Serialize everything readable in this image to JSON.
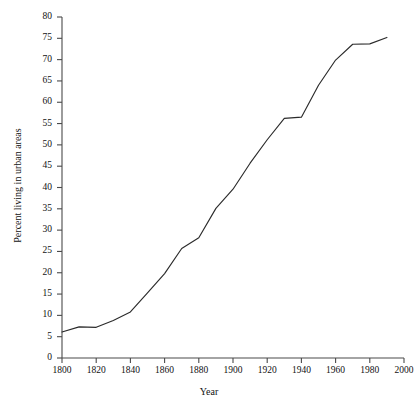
{
  "chart_data": {
    "type": "line",
    "title": "",
    "xlabel": "Year",
    "ylabel": "Percent living in urban areas",
    "xlim": [
      1800,
      2000
    ],
    "ylim": [
      0,
      80
    ],
    "xticks": [
      1800,
      1820,
      1840,
      1860,
      1880,
      1900,
      1920,
      1940,
      1960,
      1980,
      2000
    ],
    "yticks": [
      0,
      5,
      10,
      15,
      20,
      25,
      30,
      35,
      40,
      45,
      50,
      55,
      60,
      65,
      70,
      75,
      80
    ],
    "grid": false,
    "legend": false,
    "line_color": "#2b2b2b",
    "x": [
      1800,
      1810,
      1820,
      1830,
      1840,
      1850,
      1860,
      1870,
      1880,
      1890,
      1900,
      1910,
      1920,
      1930,
      1940,
      1950,
      1960,
      1970,
      1980,
      1990
    ],
    "values": [
      6.1,
      7.3,
      7.2,
      8.8,
      10.8,
      15.3,
      19.8,
      25.7,
      28.2,
      35.1,
      39.6,
      45.7,
      51.2,
      56.2,
      56.5,
      64.0,
      69.9,
      73.6,
      73.7,
      75.2
    ],
    "series": [
      {
        "name": "Percent living in urban areas",
        "values": [
          6.1,
          7.3,
          7.2,
          8.8,
          10.8,
          15.3,
          19.8,
          25.7,
          28.2,
          35.1,
          39.6,
          45.7,
          51.2,
          56.2,
          56.5,
          64.0,
          69.9,
          73.6,
          73.7,
          75.2
        ]
      }
    ]
  },
  "axes": {
    "x_title": "Year",
    "y_title": "Percent living in urban areas",
    "x_tick_labels": [
      "1800",
      "1820",
      "1840",
      "1860",
      "1880",
      "1900",
      "1920",
      "1940",
      "1960",
      "1980",
      "2000"
    ],
    "y_tick_labels": [
      "80",
      "75",
      "70",
      "65",
      "60",
      "55",
      "50",
      "45",
      "40",
      "35",
      "30",
      "25",
      "20",
      "15",
      "10",
      "5",
      "0"
    ]
  },
  "title_remnant": ""
}
